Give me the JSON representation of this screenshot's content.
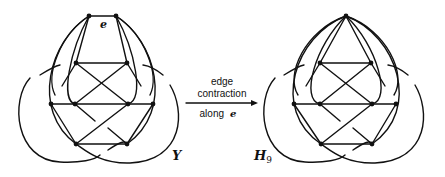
{
  "figure": {
    "left_graph": {
      "name": "Y",
      "edge_label": "e"
    },
    "right_graph": {
      "name": "H",
      "subscript": "9"
    },
    "arrow": {
      "line1": "edge",
      "line2": "contraction",
      "line3": "along",
      "line3_symbol": "e"
    }
  }
}
